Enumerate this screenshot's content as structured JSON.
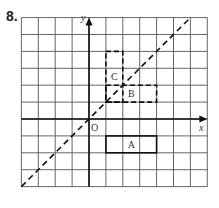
{
  "question_number": "8.",
  "grid": {
    "x_min": -4,
    "x_max": 7,
    "y_min": -4,
    "y_max": 6,
    "cell_px": 17
  },
  "axes": {
    "x_label": "x",
    "y_label": "y",
    "origin_label": "O"
  },
  "mirror_line": {
    "equation": "y = x",
    "from": [
      -4,
      -4
    ],
    "to": [
      6,
      6
    ],
    "style": "dashed"
  },
  "shapes": [
    {
      "label": "A",
      "x1": 1,
      "y1": -2,
      "x2": 4,
      "y2": -1,
      "style": "solid",
      "label_pos": [
        2.5,
        -1.5
      ]
    },
    {
      "label": "B",
      "x1": 1,
      "y1": 1,
      "x2": 4,
      "y2": 2,
      "style": "dashed",
      "label_pos": [
        2.5,
        1.5
      ]
    },
    {
      "label": "C",
      "x1": 1,
      "y1": 1,
      "x2": 2,
      "y2": 4,
      "style": "dashed",
      "label_pos": [
        1.5,
        2.5
      ]
    }
  ],
  "colors": {
    "grid": "#555555",
    "ink": "#111111"
  }
}
